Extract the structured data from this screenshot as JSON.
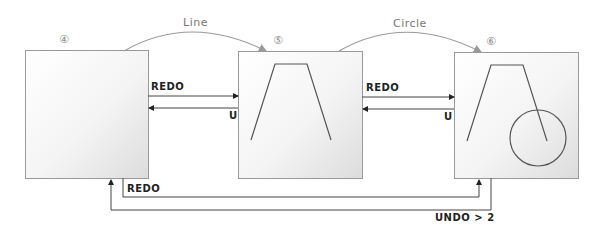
{
  "diagram": {
    "states": [
      {
        "id": "4",
        "marker": "④",
        "content": "empty canvas"
      },
      {
        "id": "5",
        "marker": "⑤",
        "content": "trapezoid line"
      },
      {
        "id": "6",
        "marker": "⑥",
        "content": "trapezoid line + circle"
      }
    ],
    "arcs": [
      {
        "label": "Line",
        "from": "4",
        "to": "5"
      },
      {
        "label": "Circle",
        "from": "5",
        "to": "6"
      }
    ],
    "transitions": {
      "redo_4_5": "REDO",
      "undo_5_4": "U",
      "redo_5_6": "REDO",
      "undo_6_5": "U",
      "redo_4_6": "REDO",
      "undo_6_4": "UNDO > 2"
    },
    "colors": {
      "box_border": "#9a9a9a",
      "box_fill_light": "#fafafa",
      "box_fill_dark": "#e0e0e0",
      "line": "#555555",
      "arc": "#999999",
      "text": "#222222"
    }
  }
}
